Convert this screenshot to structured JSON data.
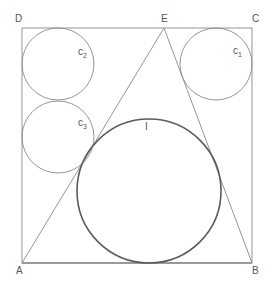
{
  "diagram": {
    "type": "geometry",
    "colors": {
      "thin_line": "#8a8a8a",
      "thick_line": "#5a5a5a",
      "label": "#555555",
      "background": "#ffffff"
    },
    "points": {
      "A": {
        "label": "A",
        "x": 22,
        "y": 263
      },
      "B": {
        "label": "B",
        "x": 252,
        "y": 263
      },
      "C": {
        "label": "C",
        "x": 252,
        "y": 28
      },
      "D": {
        "label": "D",
        "x": 22,
        "y": 28
      },
      "E": {
        "label": "E",
        "x": 164,
        "y": 28
      }
    },
    "square": "ABCD",
    "triangle": "ABE",
    "circles": [
      {
        "name": "c1",
        "label_main": "c",
        "label_sub": "1",
        "cx": 216,
        "cy": 64,
        "r": 36
      },
      {
        "name": "c2",
        "label_main": "c",
        "label_sub": "2",
        "cx": 58,
        "cy": 64,
        "r": 36
      },
      {
        "name": "c3",
        "label_main": "c",
        "label_sub": "3",
        "cx": 58,
        "cy": 137,
        "r": 36
      },
      {
        "name": "I",
        "label_main": "I",
        "label_sub": "",
        "cx": 149,
        "cy": 191,
        "r": 72
      }
    ]
  }
}
